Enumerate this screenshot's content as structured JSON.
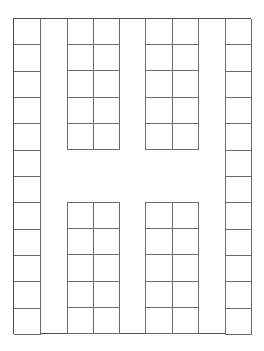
{
  "diagram": {
    "type": "grid-floor-plan",
    "line_color": "#6a6a6a",
    "frame_color": "#4a4a4a",
    "frame": {
      "x": 14,
      "y": 19,
      "width": 237,
      "height": 315
    },
    "blocks": [
      {
        "id": "left-column",
        "x": 14,
        "y": 19,
        "cols": 1,
        "rows": 12,
        "cell_w": 26,
        "cell_h": 26.25
      },
      {
        "id": "upper-left-block",
        "x": 67,
        "y": 19,
        "cols": 2,
        "rows": 5,
        "cell_w": 26,
        "cell_h": 26
      },
      {
        "id": "upper-right-block",
        "x": 145,
        "y": 19,
        "cols": 2,
        "rows": 5,
        "cell_w": 26.5,
        "cell_h": 26
      },
      {
        "id": "lower-left-block",
        "x": 67,
        "y": 202,
        "cols": 2,
        "rows": 5,
        "cell_w": 26,
        "cell_h": 26.2
      },
      {
        "id": "lower-right-block",
        "x": 145,
        "y": 202,
        "cols": 2,
        "rows": 5,
        "cell_w": 26.5,
        "cell_h": 26.2
      },
      {
        "id": "right-column",
        "x": 225,
        "y": 19,
        "cols": 1,
        "rows": 12,
        "cell_w": 26,
        "cell_h": 26.25
      }
    ]
  }
}
